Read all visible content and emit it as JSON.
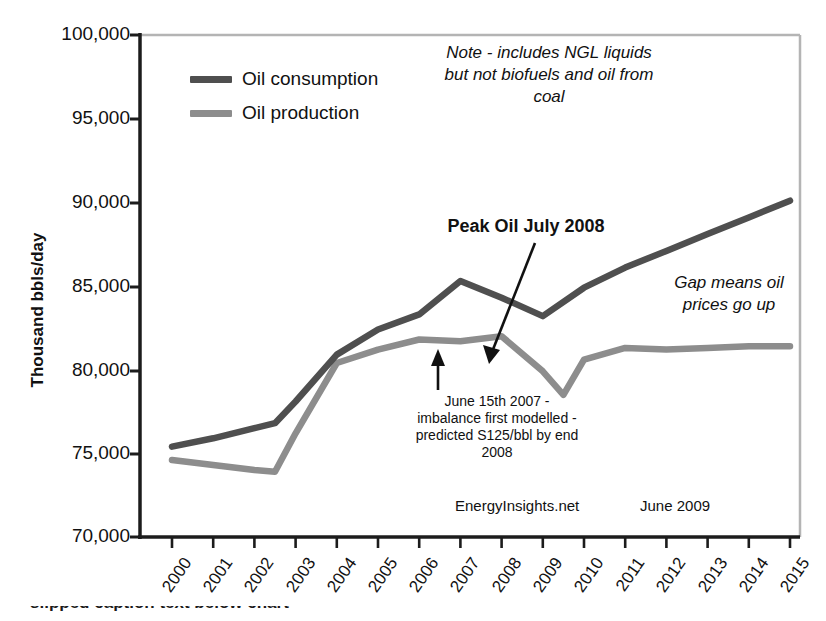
{
  "chart_data": {
    "type": "line",
    "title": "",
    "xlabel": "",
    "ylabel": "Thousand bbls/day",
    "xlim": [
      2000,
      2015
    ],
    "ylim": [
      70000,
      100000
    ],
    "ytick_step": 5000,
    "grid": false,
    "legend_position": "top-left-inside",
    "categories": [
      2000,
      2001,
      2002,
      2003,
      2004,
      2005,
      2006,
      2007,
      2008,
      2009,
      2010,
      2011,
      2012,
      2013,
      2014,
      2015
    ],
    "ytick_labels": [
      "100,000",
      "95,000",
      "90,000",
      "85,000",
      "80,000",
      "75,000",
      "70,000"
    ],
    "ytick_values": [
      100000,
      95000,
      90000,
      85000,
      80000,
      75000,
      70000
    ],
    "xtick_labels": [
      "2000",
      "2001",
      "2002",
      "2003",
      "2004",
      "2005",
      "2006",
      "2007",
      "2008",
      "2009",
      "2010",
      "2011",
      "2012",
      "2013",
      "2014",
      "2015"
    ],
    "series": [
      {
        "name": "Oil consumption",
        "color": "#4f4f4f",
        "x": [
          2000,
          2001,
          2002,
          2002.5,
          2003,
          2004,
          2005,
          2006,
          2007,
          2008,
          2009,
          2010,
          2011,
          2012,
          2013,
          2014,
          2015
        ],
        "values": [
          75400,
          75900,
          76500,
          76800,
          78100,
          80900,
          82400,
          83300,
          85300,
          84300,
          83200,
          84900,
          86100,
          87100,
          88100,
          89100,
          90100
        ]
      },
      {
        "name": "Oil production",
        "color": "#8d8d8d",
        "x": [
          2000,
          2001,
          2002,
          2002.5,
          2003,
          2004,
          2005,
          2006,
          2007,
          2008,
          2009,
          2009.5,
          2010,
          2011,
          2012,
          2013,
          2014,
          2015
        ],
        "values": [
          74600,
          74300,
          74000,
          73900,
          76200,
          80400,
          81200,
          81800,
          81700,
          82000,
          79900,
          78500,
          80600,
          81300,
          81200,
          81300,
          81400,
          81400
        ]
      }
    ],
    "annotations": [
      {
        "name": "note-ngl",
        "text": "Note - includes NGL liquids but not biofuels and oil from coal",
        "style": "italic"
      },
      {
        "name": "peak-oil",
        "text": "Peak Oil July 2008",
        "style": "bold",
        "arrow_to": [
          2008,
          82000
        ]
      },
      {
        "name": "gap-means",
        "text": "Gap means oil prices go up",
        "style": "italic"
      },
      {
        "name": "june-2007",
        "text": "June 15th 2007 - imbalance first modelled - predicted S125/bbl by end 2008",
        "style": "normal",
        "arrow_to": [
          2007.4,
          81700
        ]
      }
    ],
    "source": "EnergyInsights.net",
    "date": "June 2009"
  },
  "legend": {
    "items": [
      {
        "label": "Oil consumption",
        "color": "#4f4f4f"
      },
      {
        "label": "Oil production",
        "color": "#8d8d8d"
      }
    ]
  },
  "axis": {
    "y_title": "Thousand bbls/day"
  },
  "annotations": {
    "note": "Note - includes NGL liquids\nbut not biofuels and oil from\ncoal",
    "peak": "Peak Oil July 2008",
    "gap": "Gap means oil\nprices go up",
    "june": "June 15th 2007 -\nimbalance first modelled -\npredicted S125/bbl by end\n2008",
    "source": "EnergyInsights.net",
    "date": "June 2009"
  },
  "footer": {
    "clipped_text": "slipped caption text below chart"
  }
}
